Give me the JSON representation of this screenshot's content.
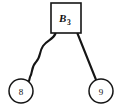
{
  "figure": {
    "title": "",
    "background_color": "#ffffff",
    "stroke_color": "#151515",
    "width": 121,
    "height": 109
  },
  "nodes": {
    "block": {
      "label_base": "B",
      "label_subscript": "3",
      "shape": "square",
      "x": 66,
      "y": 18,
      "size": 30
    },
    "leaf_left": {
      "label": "8",
      "shape": "circle",
      "x": 21,
      "y": 91,
      "radius": 12
    },
    "leaf_right": {
      "label": "9",
      "shape": "circle",
      "x": 101,
      "y": 91,
      "radius": 12
    }
  },
  "edges": [
    {
      "name": "edge-block-to-leaf-left",
      "from": "block",
      "to": "leaf_left",
      "style": "wavy",
      "path": "M 55.5,33.5 C 53,40 47,40 43,46 C 39,52 41,57 36,62 C 31,67 33,72 30,77 L 29,81"
    },
    {
      "name": "edge-block-to-leaf-right",
      "from": "block",
      "to": "leaf_right",
      "style": "straight",
      "path": "M 77.5,33.5 L 96.5,81"
    }
  ]
}
